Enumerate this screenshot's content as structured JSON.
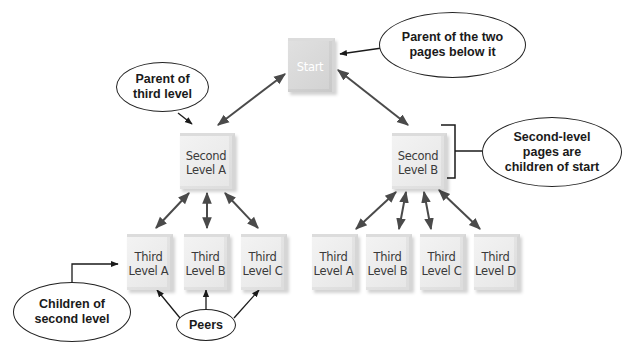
{
  "diagram": {
    "type": "website-hierarchy",
    "nodes": {
      "start": {
        "label": "Start"
      },
      "second_a": {
        "line1": "Second",
        "line2": "Level A"
      },
      "second_b": {
        "line1": "Second",
        "line2": "Level B"
      },
      "third_left": [
        {
          "line1": "Third",
          "line2": "Level A"
        },
        {
          "line1": "Third",
          "line2": "Level B"
        },
        {
          "line1": "Third",
          "line2": "Level C"
        }
      ],
      "third_right": [
        {
          "line1": "Third",
          "line2": "Level A"
        },
        {
          "line1": "Third",
          "line2": "Level B"
        },
        {
          "line1": "Third",
          "line2": "Level C"
        },
        {
          "line1": "Third",
          "line2": "Level D"
        }
      ]
    },
    "callouts": {
      "parent_of_two": {
        "line1": "Parent of the two",
        "line2": "pages below it"
      },
      "parent_of_third": {
        "line1": "Parent of",
        "line2": "third level"
      },
      "second_level_children": {
        "line1": "Second-level",
        "line2": "pages are",
        "line3": "children of start"
      },
      "children_of_second": {
        "line1": "Children of",
        "line2": "second level"
      },
      "peers": {
        "label": "Peers"
      }
    },
    "colors": {
      "arrow": "#4a4a4a",
      "callout_line": "#1a1a1a",
      "node_fill": "#ececec",
      "start_text": "#ffffff",
      "node_text": "#3a3a3a"
    }
  }
}
